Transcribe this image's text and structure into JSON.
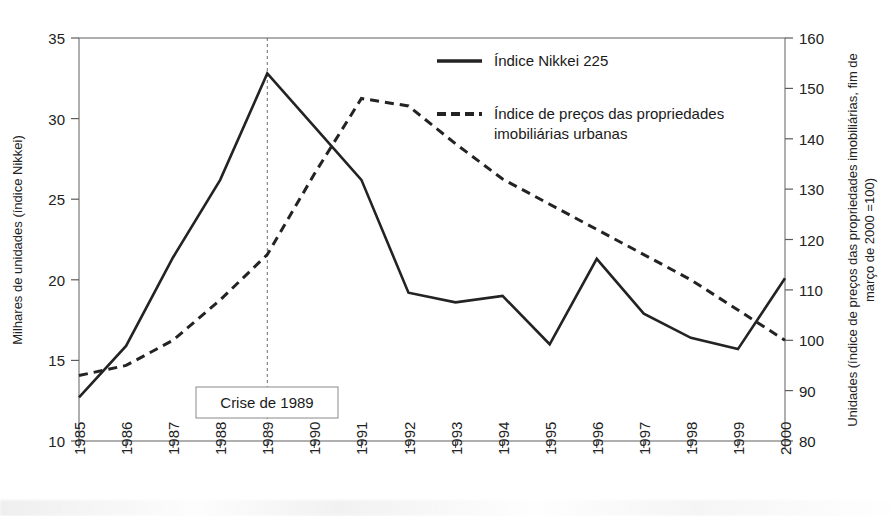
{
  "chart_data": {
    "type": "line",
    "title": "",
    "xlabel": "",
    "ylabel": "Milhares de unidades (índice Nikkei)",
    "y2label": "Unidades (índice de preços das propriedades imobiliárias, fim de março de 2000 =100)",
    "x": [
      "1985",
      "1986",
      "1987",
      "1988",
      "1989",
      "1990",
      "1991",
      "1992",
      "1993",
      "1994",
      "1995",
      "1996",
      "1997",
      "1998",
      "1999",
      "2000"
    ],
    "xtick_labels": [
      "1985",
      "1986",
      "1987",
      "1988",
      "1989",
      "1990",
      "1991",
      "1992",
      "1993",
      "1994",
      "1995",
      "1996",
      "1997",
      "1998",
      "1999",
      "2000"
    ],
    "ylim": [
      10,
      35
    ],
    "ytick_labels": [
      "10",
      "15",
      "20",
      "25",
      "30",
      "35"
    ],
    "yticks": [
      10,
      15,
      20,
      25,
      30,
      35
    ],
    "y2lim": [
      80,
      160
    ],
    "y2tick_labels": [
      "80",
      "90",
      "100",
      "110",
      "120",
      "130",
      "140",
      "150",
      "160"
    ],
    "y2ticks": [
      80,
      90,
      100,
      110,
      120,
      130,
      140,
      150,
      160
    ],
    "grid": false,
    "legend_position": "top-right",
    "series": [
      {
        "name": "Índice Nikkei 225",
        "axis": "left",
        "style": "solid",
        "color": "#232323",
        "values": [
          12.7,
          15.9,
          21.4,
          26.2,
          32.8,
          29.5,
          26.2,
          19.2,
          18.6,
          19.0,
          16.0,
          21.3,
          17.9,
          16.4,
          15.7,
          20.1
        ]
      },
      {
        "name": "Índice de preços das propriedades imobiliárias urbanas",
        "axis": "right",
        "style": "dashed",
        "color": "#232323",
        "values": [
          93.0,
          95.0,
          100.0,
          108.0,
          117.0,
          133.0,
          148.0,
          146.5,
          139.0,
          132.0,
          127.0,
          122.0,
          117.0,
          112.0,
          106.0,
          100.0
        ]
      }
    ],
    "annotations": [
      {
        "label": "Crise de 1989",
        "at_x": "1989",
        "kind": "vertical-line-with-box"
      }
    ]
  },
  "legend": {
    "items": [
      {
        "label": "Índice Nikkei 225",
        "style": "solid"
      },
      {
        "label": "Índice de preços das propriedades",
        "label2": "imobiliárias urbanas",
        "style": "dashed"
      }
    ]
  },
  "axes": {
    "left_title": "Milhares de unidades (índice Nikkei)",
    "right_title_line1": "Unidades (índice de preços das propriedades imobiliárias, fim de",
    "right_title_line2": "março de 2000 =100)",
    "left_ticks": [
      "35",
      "30",
      "25",
      "20",
      "15",
      "10"
    ],
    "right_ticks": [
      "160",
      "150",
      "140",
      "130",
      "120",
      "110",
      "100",
      "90",
      "80"
    ],
    "x_ticks": [
      "1985",
      "1986",
      "1987",
      "1988",
      "1989",
      "1990",
      "1991",
      "1992",
      "1993",
      "1994",
      "1995",
      "1996",
      "1997",
      "1998",
      "1999",
      "2000"
    ]
  },
  "annotation": {
    "crisis_label": "Crise de 1989"
  }
}
